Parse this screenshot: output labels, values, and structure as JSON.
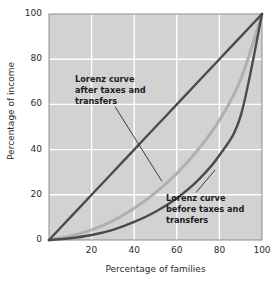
{
  "chart_data": {
    "type": "line",
    "title": "",
    "subtitle": "",
    "xlabel": "Percentage of families",
    "ylabel": "Percentage of income",
    "xlim": [
      0,
      100
    ],
    "ylim": [
      0,
      100
    ],
    "xticks": [
      0,
      20,
      40,
      60,
      80,
      100
    ],
    "xticklabels": [
      "",
      "20",
      "40",
      "60",
      "80",
      "100"
    ],
    "yticks": [
      0,
      20,
      40,
      60,
      80,
      100
    ],
    "yticklabels": [
      "0",
      "20",
      "40",
      "60",
      "80",
      "100"
    ],
    "grid": true,
    "grid_color": "#ffffff",
    "plot_background": "#d2d2d2",
    "legend": "none",
    "series": [
      {
        "name": "Line of equality",
        "color": "#4a4a52",
        "x": [
          0,
          10,
          20,
          30,
          40,
          50,
          60,
          70,
          80,
          90,
          100
        ],
        "values": [
          0,
          10,
          20,
          30,
          40,
          50,
          60,
          70,
          80,
          90,
          100
        ]
      },
      {
        "name": "Lorenz curve after taxes and transfers",
        "color": "#b0b0b0",
        "x": [
          0,
          10,
          20,
          30,
          40,
          50,
          60,
          70,
          80,
          90,
          100
        ],
        "values": [
          0,
          1.8,
          4.5,
          8.5,
          14,
          21,
          29.5,
          40,
          53,
          71,
          100
        ]
      },
      {
        "name": "Lorenz curve before taxes and transfers",
        "color": "#4a4a52",
        "x": [
          0,
          10,
          20,
          30,
          40,
          50,
          60,
          70,
          80,
          90,
          100
        ],
        "values": [
          0,
          0.8,
          2.2,
          4.5,
          8,
          12.5,
          18.5,
          26.5,
          37.5,
          55,
          100
        ]
      }
    ],
    "annotations": [
      {
        "id": "after-taxes",
        "lines": [
          "Lorenz curve",
          "after taxes and",
          "transfers"
        ],
        "text": "Lorenz curve after taxes and transfers",
        "leader_from": [
          31,
          59
        ],
        "leader_to": [
          53,
          26
        ]
      },
      {
        "id": "before-taxes",
        "lines": [
          "Lorenz curve",
          "before taxes and",
          "transfers"
        ],
        "text": "Lorenz curve before taxes and transfers",
        "leader_from": [
          78,
          31
        ],
        "leader_to": [
          69,
          21
        ]
      }
    ]
  }
}
